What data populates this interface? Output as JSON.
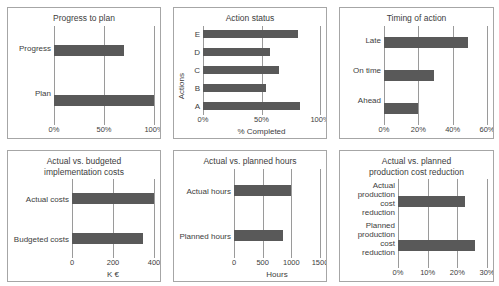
{
  "chart_data": [
    {
      "type": "bar",
      "orientation": "horizontal",
      "title": "Progress to plan",
      "categories": [
        "Progress",
        "Plan"
      ],
      "values": [
        70,
        100
      ],
      "xlabel": "",
      "ylabel": "",
      "xlim": [
        0,
        100
      ],
      "ticks": [
        0,
        50,
        100
      ],
      "tick_labels": [
        "0%",
        "50%",
        "100%"
      ],
      "grid": true,
      "legend": "none"
    },
    {
      "type": "bar",
      "orientation": "horizontal",
      "title": "Action status",
      "categories": [
        "E",
        "D",
        "C",
        "B",
        "A"
      ],
      "values": [
        81,
        57,
        65,
        54,
        83
      ],
      "xlabel": "% Completed",
      "ylabel": "Actions",
      "xlim": [
        0,
        100
      ],
      "ticks": [
        0,
        50,
        100
      ],
      "tick_labels": [
        "0%",
        "50%",
        "100%"
      ],
      "grid": true,
      "legend": "none"
    },
    {
      "type": "bar",
      "orientation": "horizontal",
      "title": "Timing of action",
      "categories": [
        "Late",
        "On time",
        "Ahead"
      ],
      "values": [
        49,
        29,
        20
      ],
      "xlabel": "",
      "ylabel": "",
      "xlim": [
        0,
        60
      ],
      "ticks": [
        0,
        20,
        40,
        60
      ],
      "tick_labels": [
        "0%",
        "20%",
        "40%",
        "60%"
      ],
      "grid": true,
      "legend": "none"
    },
    {
      "type": "bar",
      "orientation": "horizontal",
      "title": "Actual vs. budgeted\nimplementation costs",
      "categories": [
        "Actual costs",
        "Budgeted costs"
      ],
      "values": [
        400,
        345
      ],
      "xlabel": "K €",
      "ylabel": "",
      "xlim": [
        0,
        400
      ],
      "ticks": [
        0,
        200,
        400
      ],
      "tick_labels": [
        "0",
        "200",
        "400"
      ],
      "grid": true,
      "legend": "none"
    },
    {
      "type": "bar",
      "orientation": "horizontal",
      "title": "Actual vs. planned hours",
      "categories": [
        "Actual hours",
        "Planned hours"
      ],
      "values": [
        1000,
        850
      ],
      "xlabel": "Hours",
      "ylabel": "",
      "xlim": [
        0,
        1500
      ],
      "ticks": [
        0,
        500,
        1000,
        1500
      ],
      "tick_labels": [
        "0",
        "500",
        "1000",
        "1500"
      ],
      "grid": true,
      "legend": "none"
    },
    {
      "type": "bar",
      "orientation": "horizontal",
      "title": "Actual vs. planned\nproduction cost reduction",
      "categories": [
        "Actual\nproduction cost\nreduction",
        "Planned\nproduction cost\nreduction"
      ],
      "values": [
        22.5,
        26
      ],
      "xlabel": "",
      "ylabel": "",
      "xlim": [
        0,
        30
      ],
      "ticks": [
        0,
        10,
        20,
        30
      ],
      "tick_labels": [
        "0%",
        "10%",
        "20%",
        "30%"
      ],
      "grid": true,
      "legend": "none"
    }
  ],
  "style": {
    "bar_color": "#595959",
    "grid_color": "#9a9a9a",
    "border_color": "#a6a6a6",
    "text_color": "#3d3d3d",
    "background": "#ffffff"
  }
}
